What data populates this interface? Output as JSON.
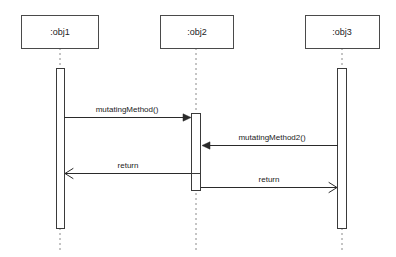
{
  "diagram": {
    "kind": "uml-sequence-diagram",
    "width": 396,
    "height": 257,
    "background_color": "#ffffff",
    "line_color": "#2a2a2a",
    "lifeline_color": "#8a8a8a",
    "box_stroke_color": "#4a4a4a",
    "text_color": "#222222"
  },
  "participants": [
    {
      "id": "obj1",
      "label": ":obj1",
      "box": {
        "x": 21,
        "y": 15,
        "width": 77,
        "height": 33
      },
      "lifeline_x": 60,
      "lifeline_top": 48,
      "lifeline_bottom": 253,
      "activations": [
        {
          "x": 56,
          "y": 68,
          "width": 8,
          "height": 160
        }
      ]
    },
    {
      "id": "obj2",
      "label": ":obj2",
      "box": {
        "x": 160,
        "y": 15,
        "width": 73,
        "height": 33
      },
      "lifeline_x": 196,
      "lifeline_top": 48,
      "lifeline_bottom": 253,
      "activations": [
        {
          "x": 192,
          "y": 113,
          "width": 9,
          "height": 77
        }
      ],
      "activation_dividers": [
        173
      ]
    },
    {
      "id": "obj3",
      "label": ":obj3",
      "box": {
        "x": 305,
        "y": 15,
        "width": 74,
        "height": 33
      },
      "lifeline_x": 342,
      "lifeline_top": 48,
      "lifeline_bottom": 253,
      "activations": [
        {
          "x": 338,
          "y": 68,
          "width": 9,
          "height": 160
        }
      ]
    }
  ],
  "messages": [
    {
      "id": "msg-mutating-method",
      "label": "mutatingMethod()",
      "from": "obj1",
      "to": "obj2",
      "direction": "right",
      "arrowhead": "solid",
      "x1": 64,
      "x2": 191,
      "y": 117,
      "label_x": 127,
      "label_y": 112
    },
    {
      "id": "msg-mutating-method2",
      "label": "mutatingMethod2()",
      "from": "obj3",
      "to": "obj2",
      "direction": "left",
      "arrowhead": "solid",
      "x1": 338,
      "x2": 202,
      "y": 145,
      "label_x": 272,
      "label_y": 140
    },
    {
      "id": "msg-return-to-obj1",
      "label": "return",
      "from": "obj2",
      "to": "obj1",
      "direction": "left",
      "arrowhead": "open",
      "x1": 192,
      "x2": 65,
      "y": 173,
      "label_x": 128,
      "label_y": 168
    },
    {
      "id": "msg-return-to-obj3",
      "label": "return",
      "from": "obj2",
      "to": "obj3",
      "direction": "right",
      "arrowhead": "open",
      "x1": 201,
      "x2": 337,
      "y": 187,
      "label_x": 269,
      "label_y": 182
    }
  ]
}
